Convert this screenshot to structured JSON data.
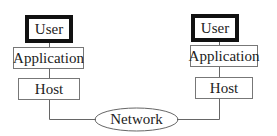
{
  "diagram": {
    "left_stack": {
      "user": "User",
      "application": "Application",
      "host": "Host"
    },
    "right_stack": {
      "user": "User",
      "application": "Application",
      "host": "Host"
    },
    "network": "Network"
  }
}
